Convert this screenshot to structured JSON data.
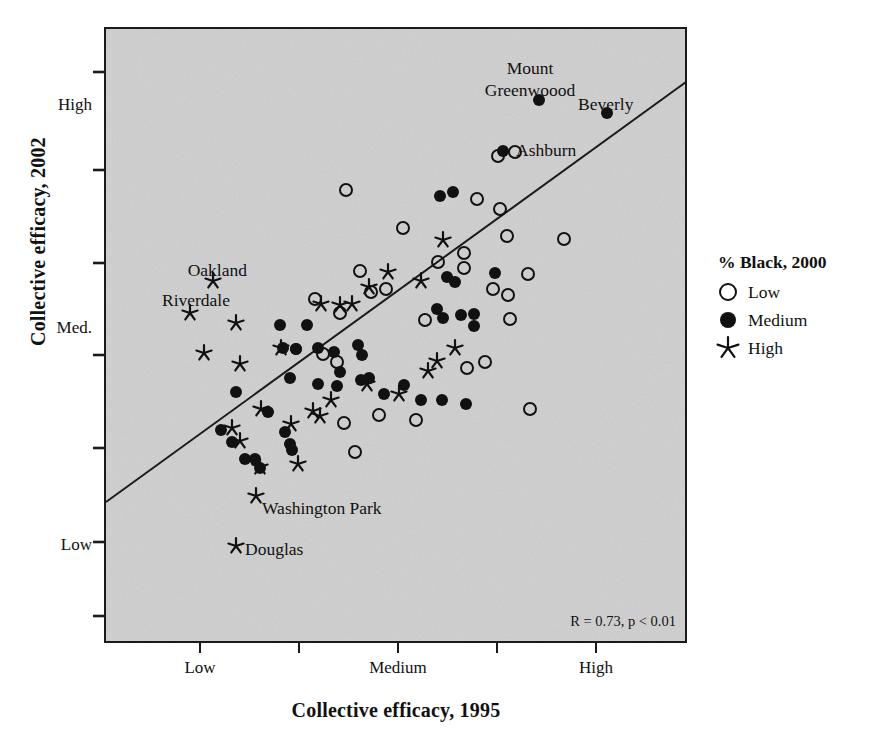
{
  "figure": {
    "x_axis_title": "Collective efficacy, 1995",
    "y_axis_title": "Collective efficacy, 2002",
    "stat_annotation": "R = 0.73, p < 0.01",
    "plot_background_color": "#cfcfcf",
    "frame_color": "#1a1a1a",
    "marker_color": "#111111"
  },
  "legend": {
    "title": "% Black, 2000",
    "items": [
      {
        "label": "Low",
        "marker": "open-circle-icon"
      },
      {
        "label": "Medium",
        "marker": "filled-circle-icon"
      },
      {
        "label": "High",
        "marker": "star-icon"
      }
    ]
  },
  "chart_data": {
    "type": "scatter",
    "title": "",
    "xlabel": "Collective efficacy, 1995",
    "ylabel": "Collective efficacy, 2002",
    "grid": false,
    "legend_position": "right",
    "annotations": [
      {
        "text": "R = 0.73, p < 0.01",
        "x_px": 677,
        "y_px": 622,
        "anchor": "end"
      },
      {
        "text": "Mount",
        "x_px": 530,
        "y_px": 68,
        "anchor": "middle"
      },
      {
        "text": "Greenwoood",
        "x_px": 530,
        "y_px": 90,
        "anchor": "middle"
      },
      {
        "text": "Beverly",
        "x_px": 618,
        "y_px": 104,
        "anchor": "middle"
      },
      {
        "text": "Ashburn",
        "x_px": 553,
        "y_px": 152,
        "anchor": "middle"
      },
      {
        "text": "Oakland",
        "x_px": 206,
        "y_px": 270,
        "anchor": "middle"
      },
      {
        "text": "Riverdale",
        "x_px": 175,
        "y_px": 300,
        "anchor": "middle"
      },
      {
        "text": "Washington Park",
        "x_px": 330,
        "y_px": 508,
        "anchor": "middle"
      },
      {
        "text": "Douglas",
        "x_px": 277,
        "y_px": 549,
        "anchor": "middle"
      }
    ],
    "xticklabels": [
      "",
      "Low",
      "",
      "Medium",
      "",
      "High",
      ""
    ],
    "xtick_px": [
      200,
      299,
      398,
      497,
      596
    ],
    "xtick_labels_visible": [
      {
        "label": "Low",
        "x_px": 200
      },
      {
        "label": "Medium",
        "x_px": 398
      },
      {
        "label": "High",
        "x_px": 596
      }
    ],
    "ytick_px": [
      72,
      170,
      263,
      355,
      448,
      542,
      616
    ],
    "ytick_labels_visible": [
      {
        "label": "High",
        "y_px": 105
      },
      {
        "label": "Med.",
        "y_px": 328
      },
      {
        "label": "Low",
        "y_px": 545
      }
    ],
    "axis_ranges": {
      "x_px": [
        105,
        686
      ],
      "y_px": [
        28,
        642
      ]
    },
    "regression_line": {
      "x1_px": 106,
      "y1_px": 502,
      "x2_px": 686,
      "y2_px": 82
    },
    "series": [
      {
        "name": "Low",
        "marker": "open-circle",
        "points_px": [
          [
            346,
            190
          ],
          [
            403,
            228
          ],
          [
            438,
            262
          ],
          [
            477,
            199
          ],
          [
            500,
            209
          ],
          [
            464,
            253
          ],
          [
            464,
            268
          ],
          [
            507,
            236
          ],
          [
            528,
            274
          ],
          [
            498,
            156
          ],
          [
            515,
            152
          ],
          [
            564,
            239
          ],
          [
            508,
            295
          ],
          [
            510,
            319
          ],
          [
            485,
            362
          ],
          [
            467,
            368
          ],
          [
            360,
            271
          ],
          [
            371,
            292
          ],
          [
            386,
            289
          ],
          [
            340,
            313
          ],
          [
            315,
            299
          ],
          [
            323,
            354
          ],
          [
            337,
            362
          ],
          [
            344,
            423
          ],
          [
            355,
            452
          ],
          [
            379,
            415
          ],
          [
            416,
            420
          ],
          [
            425,
            320
          ],
          [
            530,
            409
          ],
          [
            493,
            289
          ]
        ]
      },
      {
        "name": "Medium",
        "marker": "filled-circle",
        "points_px": [
          [
            453,
            192
          ],
          [
            539,
            100
          ],
          [
            607,
            113
          ],
          [
            503,
            151
          ],
          [
            440,
            196
          ],
          [
            447,
            277
          ],
          [
            455,
            282
          ],
          [
            495,
            273
          ],
          [
            437,
            309
          ],
          [
            443,
            318
          ],
          [
            461,
            315
          ],
          [
            474,
            314
          ],
          [
            474,
            326
          ],
          [
            280,
            325
          ],
          [
            307,
            325
          ],
          [
            283,
            348
          ],
          [
            296,
            349
          ],
          [
            358,
            345
          ],
          [
            290,
            378
          ],
          [
            318,
            348
          ],
          [
            334,
            352
          ],
          [
            362,
            355
          ],
          [
            296,
            349
          ],
          [
            236,
            392
          ],
          [
            268,
            412
          ],
          [
            221,
            430
          ],
          [
            232,
            442
          ],
          [
            285,
            432
          ],
          [
            290,
            444
          ],
          [
            292,
            450
          ],
          [
            318,
            384
          ],
          [
            337,
            386
          ],
          [
            361,
            380
          ],
          [
            369,
            378
          ],
          [
            384,
            394
          ],
          [
            404,
            385
          ],
          [
            421,
            400
          ],
          [
            442,
            400
          ],
          [
            466,
            404
          ],
          [
            340,
            372
          ],
          [
            245,
            459
          ],
          [
            255,
            459
          ],
          [
            260,
            468
          ]
        ]
      },
      {
        "name": "High",
        "marker": "star",
        "points_px": [
          [
            213,
            281
          ],
          [
            190,
            313
          ],
          [
            236,
            323
          ],
          [
            204,
            353
          ],
          [
            240,
            364
          ],
          [
            281,
            348
          ],
          [
            321,
            304
          ],
          [
            340,
            305
          ],
          [
            352,
            304
          ],
          [
            369,
            287
          ],
          [
            388,
            272
          ],
          [
            421,
            281
          ],
          [
            443,
            240
          ],
          [
            428,
            371
          ],
          [
            399,
            394
          ],
          [
            437,
            361
          ],
          [
            455,
            348
          ],
          [
            331,
            400
          ],
          [
            313,
            411
          ],
          [
            320,
            416
          ],
          [
            291,
            424
          ],
          [
            261,
            409
          ],
          [
            232,
            428
          ],
          [
            240,
            441
          ],
          [
            260,
            467
          ],
          [
            298,
            464
          ],
          [
            367,
            384
          ],
          [
            256,
            496
          ],
          [
            236,
            546
          ]
        ]
      }
    ]
  }
}
